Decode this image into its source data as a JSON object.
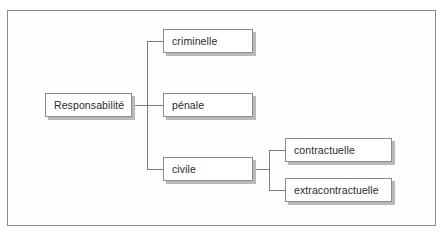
{
  "diagram": {
    "type": "tree",
    "root": {
      "label": "Responsabilité",
      "children": [
        {
          "label": "criminelle"
        },
        {
          "label": "pénale"
        },
        {
          "label": "civile",
          "children": [
            {
              "label": "contractuelle"
            },
            {
              "label": "extracontractuelle"
            }
          ]
        }
      ]
    }
  },
  "nodes": {
    "root": "Responsabilité",
    "criminelle": "criminelle",
    "penale": "pénale",
    "civile": "civile",
    "contractuelle": "contractuelle",
    "extracontractuelle": "extracontractuelle"
  },
  "colors": {
    "border": "#8c8c8c",
    "shadow": "#b9b9b9",
    "connector": "#7d7d7d",
    "text": "#2a2a2a",
    "background": "#ffffff"
  }
}
